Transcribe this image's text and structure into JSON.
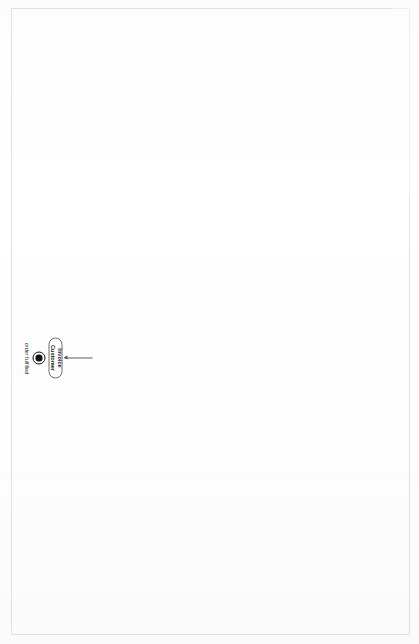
{
  "diagram": {
    "frame_label": "act Ex.SB: Sales Order Process & Function",
    "partitions": [
      {
        "id": "sales_dept",
        "label": "Sales Dept."
      },
      {
        "id": "fulfil_order",
        "label": "Fulfil Order"
      }
    ],
    "notes": [
      {
        "id": "note_singleton",
        "lines": [
          "This Activity has the property isSingleExecution = false, so there",
          "is a new instance of it for every Sales Order, each with its",
          "own set of tokens."
        ]
      },
      {
        "id": "note_classifier_behaviour",
        "lines": [
          "This Activity has the property isSingleExecution = true.",
          "Once instantiated, the instance will handle all Sales",
          "Orders, until it is abolished.",
          "This Activity models the behaviour of a Business",
          "Function rather than that of a Business Process."
        ]
      }
    ],
    "nodes": [
      {
        "id": "init_sales_dept",
        "type": "initial-node",
        "label": "Sales Dept. created"
      },
      {
        "id": "accept_customer_calls_left",
        "type": "accept-event",
        "label": "customer calls"
      },
      {
        "id": "accept_sales_dept_abolished",
        "type": "accept-event",
        "label": "Sales Dept. abolished"
      },
      {
        "id": "action_record_order_left",
        "type": "action",
        "label": "Record Order"
      },
      {
        "id": "action_closedown_dept",
        "type": "action",
        "label": "Closedown Dept."
      },
      {
        "id": "final_sales_dept_closed_down",
        "type": "activity-final",
        "label": "Sales Dept. closed down"
      },
      {
        "id": "action_allocate_stock",
        "type": "action",
        "label": "Allocate Stock"
      },
      {
        "id": "action_prepare_despatch_left",
        "type": "action",
        "label": "Prepare Despatch"
      },
      {
        "id": "action_despatch_goods_left",
        "type": "action",
        "label": "Despatch Goods"
      },
      {
        "id": "flowfinal_left",
        "type": "flow-final",
        "label": ""
      },
      {
        "id": "init_customer_calls_right",
        "type": "initial-node",
        "label": "customer calls"
      },
      {
        "id": "action_record_order_right",
        "type": "action",
        "label": "Record Order"
      },
      {
        "id": "action_prepare_despatch_right",
        "type": "action",
        "label": "Prepare Despatch"
      },
      {
        "id": "action_despatch_goods_right",
        "type": "action",
        "label": "Despatch Goods"
      },
      {
        "id": "action_invoice_customer",
        "type": "action",
        "label": "Invoice Customer"
      },
      {
        "id": "final_order_fulfilled",
        "type": "activity-final",
        "label": "order fulfilled"
      }
    ],
    "colors": {
      "line": "#5e5e5e",
      "node_border": "#6f6f6f",
      "frame_border": "#8a8a8a",
      "text": "#151515",
      "fill": "#ffffff"
    }
  }
}
